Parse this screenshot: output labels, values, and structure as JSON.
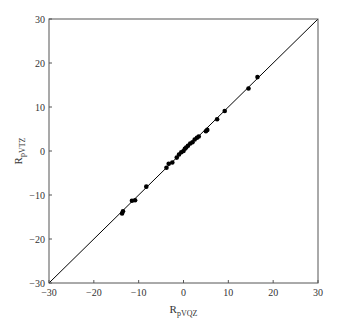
{
  "chart_data": {
    "type": "scatter",
    "title": "",
    "xlabel": "R_pVQZ",
    "ylabel": "R_pVTZ",
    "xlabel_main": "R",
    "xlabel_sub": "pVQZ",
    "ylabel_main": "R",
    "ylabel_sub": "pVTZ",
    "xlim": [
      -30,
      30
    ],
    "ylim": [
      -30,
      30
    ],
    "xticks": [
      -30,
      -20,
      -10,
      0,
      10,
      20,
      30
    ],
    "yticks": [
      -30,
      -20,
      -10,
      0,
      10,
      20,
      30
    ],
    "xtick_labels": [
      "−30",
      "−20",
      "−10",
      "0",
      "10",
      "20",
      "30"
    ],
    "ytick_labels": [
      "−30",
      "−20",
      "−10",
      "0",
      "10",
      "20",
      "30"
    ],
    "grid": false,
    "legend": null,
    "reference_line": {
      "type": "y=x",
      "from": [
        -30,
        -30
      ],
      "to": [
        30,
        30
      ],
      "color": "#000000"
    },
    "marker_color": "#000000",
    "series": [
      {
        "name": "data",
        "points": [
          [
            -13.7,
            -14.2
          ],
          [
            -13.5,
            -13.7
          ],
          [
            -11.5,
            -11.3
          ],
          [
            -10.8,
            -11.2
          ],
          [
            -8.3,
            -8.1
          ],
          [
            -3.8,
            -3.8
          ],
          [
            -3.3,
            -2.9
          ],
          [
            -2.5,
            -2.6
          ],
          [
            -1.5,
            -1.5
          ],
          [
            -1.0,
            -0.8
          ],
          [
            -0.5,
            -0.3
          ],
          [
            0.0,
            0.0
          ],
          [
            0.3,
            0.5
          ],
          [
            0.6,
            0.8
          ],
          [
            1.0,
            1.2
          ],
          [
            1.5,
            1.7
          ],
          [
            2.0,
            2.0
          ],
          [
            2.5,
            2.6
          ],
          [
            3.0,
            3.0
          ],
          [
            3.4,
            3.3
          ],
          [
            5.0,
            4.5
          ],
          [
            5.3,
            4.8
          ],
          [
            7.5,
            7.2
          ],
          [
            9.2,
            9.1
          ],
          [
            14.5,
            14.2
          ],
          [
            16.5,
            16.8
          ]
        ]
      }
    ]
  }
}
